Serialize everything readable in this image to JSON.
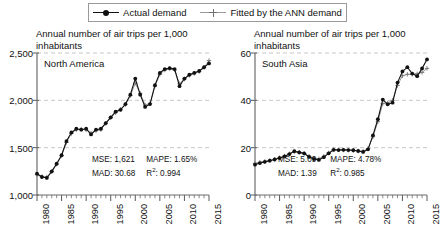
{
  "legend": {
    "entries": [
      {
        "label": "Actual demand",
        "marker": "filled-circle",
        "line_color": "#111111"
      },
      {
        "label": "Fitted by the ANN demand",
        "marker": "plus",
        "line_color": "#9b9b9b"
      }
    ]
  },
  "chart_data": [
    {
      "type": "line",
      "title": "North America",
      "ylabel": "Annual number of air trips per 1,000 inhabitants",
      "xlabel": "",
      "xlim": [
        1980,
        2015
      ],
      "ylim": [
        1000,
        2500
      ],
      "yticks": [
        1000,
        1500,
        2000,
        2500
      ],
      "ytick_labels": [
        "1,000",
        "1,500",
        "2,000",
        "2,500"
      ],
      "xticks": [
        1980,
        1985,
        1990,
        1995,
        2000,
        2005,
        2010,
        2015
      ],
      "xtick_labels": [
        "1980",
        "1985",
        "1990",
        "1995",
        "2000",
        "2005",
        "2010",
        "2015"
      ],
      "grid": "horizontal-dashed",
      "legend_position": "top-shared",
      "x": [
        1980,
        1981,
        1982,
        1983,
        1984,
        1985,
        1986,
        1987,
        1988,
        1989,
        1990,
        1991,
        1992,
        1993,
        1994,
        1995,
        1996,
        1997,
        1998,
        1999,
        2000,
        2001,
        2002,
        2003,
        2004,
        2005,
        2006,
        2007,
        2008,
        2009,
        2010,
        2011,
        2012,
        2013,
        2014,
        2015
      ],
      "series": [
        {
          "name": "Actual demand",
          "values": [
            1225,
            1190,
            1180,
            1250,
            1330,
            1420,
            1570,
            1660,
            1700,
            1690,
            1700,
            1640,
            1690,
            1700,
            1760,
            1820,
            1880,
            1900,
            1960,
            2060,
            2230,
            2060,
            1930,
            1960,
            2160,
            2290,
            2330,
            2340,
            2330,
            2150,
            2230,
            2270,
            2290,
            2310,
            2350,
            2390
          ]
        },
        {
          "name": "Fitted by the ANN demand",
          "values": [
            1215,
            1195,
            1190,
            1245,
            1325,
            1415,
            1555,
            1650,
            1690,
            1695,
            1690,
            1655,
            1680,
            1690,
            1755,
            1815,
            1870,
            1905,
            1955,
            2050,
            2180,
            2075,
            1950,
            1965,
            2150,
            2275,
            2320,
            2335,
            2320,
            2175,
            2225,
            2265,
            2285,
            2305,
            2345,
            2420
          ]
        }
      ],
      "annotations": {
        "MSE": "1,621",
        "MAPE": "1.65%",
        "MAD": "30.68",
        "R2": "0.994"
      }
    },
    {
      "type": "line",
      "title": "South Asia",
      "ylabel": "Annual number of air trips per 1,000 inhabitants",
      "xlabel": "",
      "xlim": [
        1980,
        2015
      ],
      "ylim": [
        0,
        60
      ],
      "yticks": [
        0,
        20,
        40,
        60
      ],
      "ytick_labels": [
        "0",
        "20",
        "40",
        "60"
      ],
      "xticks": [
        1980,
        1985,
        1990,
        1995,
        2000,
        2005,
        2010,
        2015
      ],
      "xtick_labels": [
        "1980",
        "1985",
        "1990",
        "1995",
        "2000",
        "2005",
        "2010",
        "2015"
      ],
      "grid": "horizontal-dashed",
      "legend_position": "top-shared",
      "x": [
        1980,
        1981,
        1982,
        1983,
        1984,
        1985,
        1986,
        1987,
        1988,
        1989,
        1990,
        1991,
        1992,
        1993,
        1994,
        1995,
        1996,
        1997,
        1998,
        1999,
        2000,
        2001,
        2002,
        2003,
        2004,
        2005,
        2006,
        2007,
        2008,
        2009,
        2010,
        2011,
        2012,
        2013,
        2014,
        2015
      ],
      "series": [
        {
          "name": "Actual demand",
          "values": [
            12.8,
            13.5,
            14.0,
            14.5,
            15.0,
            15.6,
            16.3,
            17.3,
            18.5,
            18.0,
            17.6,
            16.1,
            15.2,
            14.8,
            16.0,
            17.6,
            19.1,
            19.0,
            19.1,
            19.0,
            18.9,
            18.6,
            18.2,
            19.3,
            25.2,
            32.0,
            40.3,
            38.3,
            39.0,
            47.5,
            52.2,
            54.0,
            51.3,
            50.2,
            53.5,
            57.3
          ]
        },
        {
          "name": "Fitted by the ANN demand",
          "values": [
            13.4,
            13.8,
            14.2,
            14.6,
            15.1,
            15.8,
            16.5,
            17.4,
            18.2,
            18.1,
            17.5,
            16.4,
            15.6,
            15.3,
            16.3,
            17.8,
            19.2,
            19.1,
            19.0,
            18.9,
            18.8,
            18.6,
            18.5,
            19.6,
            24.6,
            31.0,
            38.6,
            38.9,
            40.0,
            46.3,
            50.4,
            51.0,
            51.0,
            51.2,
            51.8,
            53.5
          ]
        }
      ],
      "annotations": {
        "MSE": "5.09",
        "MAPE": "4.78%",
        "MAD": "1.39",
        "R2": "0.985"
      }
    }
  ],
  "labels": {
    "mse": "MSE:",
    "mape": "MAPE:",
    "mad": "MAD:",
    "r2_prefix": "R",
    "r2_sup": "2",
    "r2_suffix": ":"
  }
}
